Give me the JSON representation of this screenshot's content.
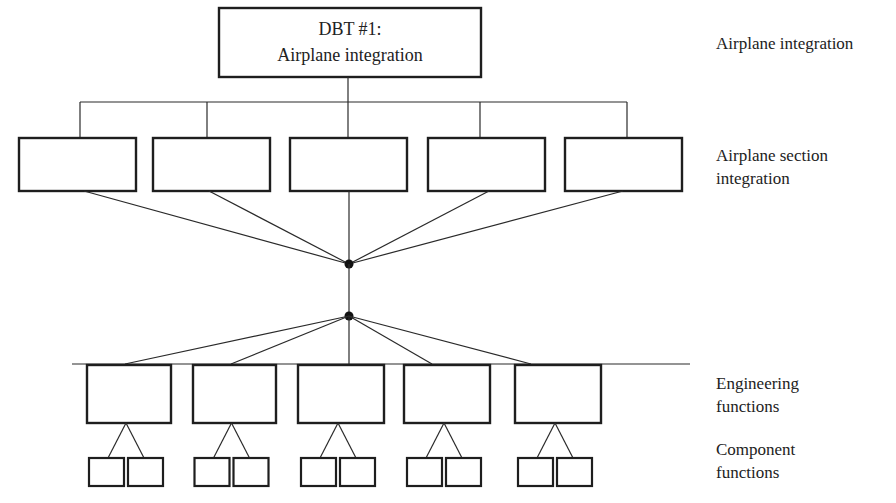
{
  "diagram": {
    "top_box": {
      "line1": "DBT #1:",
      "line2": "Airplane integration"
    },
    "section_boxes_count": 5,
    "engineering_boxes_count": 5,
    "component_boxes_per_engineering": 2,
    "level_labels": {
      "airplane_integration": [
        "Airplane integration"
      ],
      "airplane_section_integration": [
        "Airplane section",
        "integration"
      ],
      "engineering_functions": [
        "Engineering",
        "functions"
      ],
      "component_functions": [
        "Component",
        "functions"
      ]
    },
    "colors": {
      "stroke": "#1e1e1e",
      "text": "#222222",
      "background": "#ffffff"
    }
  }
}
